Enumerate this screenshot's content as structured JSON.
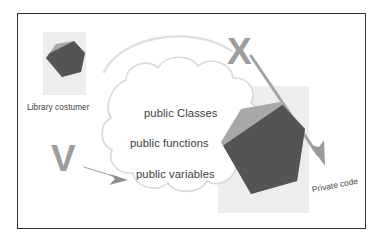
{
  "diagram": {
    "title_present": false,
    "frame": {
      "border_color": "#2e2e2e",
      "background": "#ffffff"
    },
    "left_actor": {
      "label": "Library costumer",
      "icon": "hexagon-split-icon"
    },
    "right_component": {
      "icon": "hexagon-split-icon"
    },
    "cloud": {
      "lines": [
        "public Classes",
        "public functions",
        "public variables"
      ]
    },
    "markers": {
      "allowed_letter": "V",
      "forbidden_letter": "X"
    },
    "private_label": "Private code",
    "colors": {
      "hex_light": "#a8a8a8",
      "hex_dark": "#545454",
      "marker_grey": "#9d9d9d",
      "arrow_grey": "#8f8f8f",
      "arc_grey": "#d6d6d6",
      "cloud_outline": "#d9d9d9",
      "wash": "#ededed",
      "text": "#3b3b3b",
      "frame_border": "#2e2e2e"
    }
  }
}
